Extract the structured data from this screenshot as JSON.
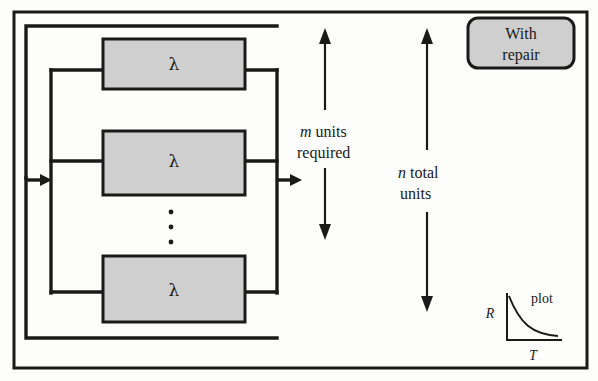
{
  "diagram": {
    "frame": {
      "stroke_color": "#1a1a1a",
      "fill_color": "#fdfdfc"
    },
    "blocks": [
      {
        "id": "block-top",
        "label": "λ",
        "icon": "lambda-block"
      },
      {
        "id": "block-middle",
        "label": "λ",
        "icon": "lambda-block"
      },
      {
        "id": "block-bottom",
        "label": "λ",
        "icon": "lambda-block"
      }
    ],
    "block_style": {
      "fill_color": "#cfcfcf",
      "stroke_color": "#1a1a1a"
    },
    "continuation": {
      "name": "vertical-ellipsis",
      "dot_count": 3,
      "color": "#1a1a1a"
    },
    "ports": {
      "input_arrow": "input-flow-arrow",
      "output_arrow": "output-flow-arrow"
    },
    "dimension_arrows": [
      {
        "id": "m-units-arrow",
        "line1": "m units",
        "line2": "required",
        "italic_symbol": "m",
        "rest1": " units",
        "rest2": "required"
      },
      {
        "id": "n-total-arrow",
        "line1": "n total",
        "line2": "units",
        "italic_symbol": "n",
        "rest1": " total",
        "rest2": "units"
      }
    ],
    "badge": {
      "id": "with-repair-badge",
      "line1": "With",
      "line2": "repair",
      "fill_color": "#cfcfcf",
      "stroke_color": "#1a1a1a"
    },
    "inset_plot": {
      "id": "reliability-plot-inset",
      "y_axis_label": "R",
      "x_axis_label": "T",
      "caption": "plot",
      "curve_shape": "decaying-exponential",
      "stroke_color": "#1a1a1a"
    }
  }
}
